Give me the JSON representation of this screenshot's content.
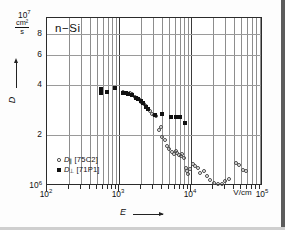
{
  "chart_data": {
    "type": "scatter",
    "title": "n−Si",
    "xlabel": "E",
    "ylabel": "D",
    "x_unit": "V/cm",
    "y_unit_numerator": "cm²",
    "y_unit_denominator": "s",
    "xscale": "log",
    "yscale": "log",
    "xlim": [
      100,
      100000
    ],
    "ylim": [
      1000000,
      10000000
    ],
    "grid": true,
    "legend_position": "bottom-left",
    "x_ticks": [
      {
        "value": 100,
        "label": "10",
        "exp": "2",
        "major": true
      },
      {
        "value": 1000,
        "label": "10",
        "exp": "3",
        "major": true
      },
      {
        "value": 10000,
        "label": "10",
        "exp": "4",
        "major": true
      },
      {
        "value": 100000,
        "label": "10",
        "exp": "5",
        "major": true
      }
    ],
    "y_ticks": [
      {
        "value": 10000000,
        "label": "10",
        "exp": "7"
      },
      {
        "value": 8000000,
        "label": "8"
      },
      {
        "value": 6000000,
        "label": "6"
      },
      {
        "value": 4000000,
        "label": "4"
      },
      {
        "value": 2000000,
        "label": "2"
      },
      {
        "value": 1000000,
        "label": "10",
        "exp": "6"
      }
    ],
    "series": [
      {
        "name": "D_parallel",
        "symbol": "open-circle",
        "label": "D",
        "subscript": "∥",
        "reference": "[75C2]",
        "points": [
          [
            1150,
            3620000
          ],
          [
            1280,
            3580000
          ],
          [
            1400,
            3560000
          ],
          [
            1520,
            3520000
          ],
          [
            1680,
            3400000
          ],
          [
            1800,
            3330000
          ],
          [
            1950,
            3240000
          ],
          [
            2050,
            3180000
          ],
          [
            2200,
            3090000
          ],
          [
            2350,
            2990000
          ],
          [
            2500,
            2880000
          ],
          [
            2700,
            2800000
          ],
          [
            2900,
            2700000
          ],
          [
            3100,
            2660000
          ],
          [
            3300,
            2620000
          ],
          [
            3550,
            2160000
          ],
          [
            3800,
            2250000
          ],
          [
            4000,
            1960000
          ],
          [
            4300,
            1880000
          ],
          [
            4600,
            1720000
          ],
          [
            5000,
            1660000
          ],
          [
            5400,
            1600000
          ],
          [
            5800,
            1560000
          ],
          [
            6100,
            1620000
          ],
          [
            6400,
            1580000
          ],
          [
            6800,
            1540000
          ],
          [
            7200,
            1500000
          ],
          [
            7600,
            1560000
          ],
          [
            8000,
            1460000
          ],
          [
            8400,
            1280000
          ],
          [
            8800,
            1220000
          ],
          [
            9200,
            1180000
          ],
          [
            9600,
            1260000
          ],
          [
            10500,
            1360000
          ],
          [
            11500,
            1320000
          ],
          [
            12500,
            1280000
          ],
          [
            13500,
            1200000
          ],
          [
            15000,
            1230000
          ],
          [
            16500,
            1140000
          ],
          [
            18500,
            1080000
          ],
          [
            21000,
            1040000
          ],
          [
            24000,
            1030000
          ],
          [
            27000,
            1030000
          ],
          [
            30000,
            1070000
          ],
          [
            34000,
            1100000
          ],
          [
            42000,
            1380000
          ],
          [
            46000,
            1330000
          ],
          [
            52000,
            1250000
          ],
          [
            58000,
            1230000
          ]
        ]
      },
      {
        "name": "D_perpendicular",
        "symbol": "filled-square",
        "label": "D",
        "subscript": "⊥",
        "reference": "[71P1]",
        "points": [
          [
            560,
            3800000
          ],
          [
            560,
            3560000
          ],
          [
            680,
            3620000
          ],
          [
            880,
            3840000
          ],
          [
            1150,
            3580000
          ],
          [
            1250,
            3560000
          ],
          [
            1350,
            3540000
          ],
          [
            1500,
            3480000
          ],
          [
            1700,
            3360000
          ],
          [
            1850,
            3290000
          ],
          [
            2000,
            3210000
          ],
          [
            2150,
            3120000
          ],
          [
            2350,
            2950000
          ],
          [
            2550,
            2880000
          ],
          [
            3200,
            2640000
          ],
          [
            3900,
            2680000
          ],
          [
            5300,
            2580000
          ],
          [
            6200,
            2580000
          ],
          [
            7000,
            2570000
          ],
          [
            8200,
            2360000
          ]
        ]
      }
    ]
  },
  "annotations": {
    "sample_label": "n−Si"
  }
}
